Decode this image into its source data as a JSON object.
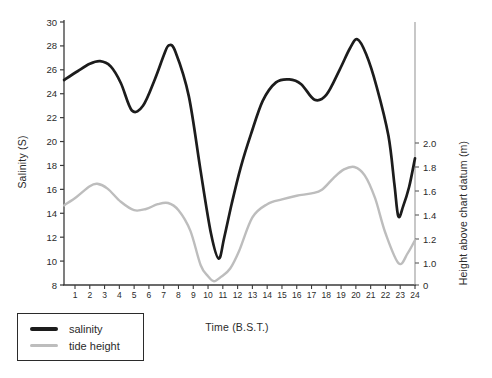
{
  "figure": {
    "background": "#ffffff"
  },
  "axes": {
    "left": {
      "label": "Salinity (S)",
      "ticks": [
        "30",
        "28",
        "26",
        "24",
        "22",
        "20",
        "18",
        "16",
        "14",
        "12",
        "10",
        "8"
      ]
    },
    "right": {
      "label": "Height above chart datum (m)",
      "ticks": [
        "2.0",
        "1.8",
        "1.6",
        "1.4",
        "1.2",
        "1.0",
        "0"
      ]
    },
    "x": {
      "label": "Time (B.S.T.)",
      "ticks": [
        "1",
        "2",
        "3",
        "4",
        "5",
        "6",
        "7",
        "8",
        "9",
        "10",
        "11",
        "12",
        "13",
        "14",
        "15",
        "16",
        "17",
        "18",
        "19",
        "20",
        "21",
        "22",
        "23",
        "24"
      ]
    }
  },
  "legend": {
    "items": [
      {
        "label": "salinity",
        "color": "#1c1c1c"
      },
      {
        "label": "tide height",
        "color": "#bdbdbd"
      }
    ]
  },
  "chart_data": {
    "type": "line",
    "title": "",
    "xlabel": "Time (B.S.T.)",
    "ylabel_left": "Salinity (S)",
    "ylabel_right": "Height above chart datum (m)",
    "grid": false,
    "legend_position": "bottom-left-outside",
    "x_hours": [
      1,
      2,
      3,
      4,
      5,
      6,
      7,
      8,
      9,
      10,
      11,
      12,
      13,
      14,
      15,
      16,
      17,
      18,
      19,
      20,
      21,
      22,
      23,
      24
    ],
    "ylim_left": [
      8,
      30
    ],
    "right_axis_tick_labels": [
      "2.0",
      "1.8",
      "1.6",
      "1.4",
      "1.2",
      "1.0",
      "0"
    ],
    "series": [
      {
        "name": "salinity",
        "axis": "left",
        "color": "#1c1c1c",
        "values": [
          25.7,
          26.5,
          26.6,
          25.2,
          22.7,
          24.1,
          27.5,
          27.2,
          21.0,
          13.2,
          11.5,
          16.5,
          20.5,
          24.3,
          25.1,
          25.2,
          23.7,
          23.9,
          26.3,
          28.5,
          25.8,
          21.0,
          14.0,
          18.6
        ]
      },
      {
        "name": "tide height",
        "axis": "right",
        "color": "#bdbdbd",
        "values": [
          1.54,
          1.64,
          1.63,
          1.52,
          1.44,
          1.46,
          1.5,
          1.44,
          1.15,
          0.35,
          0.45,
          1.08,
          1.38,
          1.49,
          1.53,
          1.56,
          1.58,
          1.66,
          1.77,
          1.8,
          1.62,
          1.25,
          0.98,
          1.19
        ]
      }
    ],
    "keypoints": {
      "salinity": [
        [
          0.26,
          25.15
        ],
        [
          1.2,
          25.9
        ],
        [
          2.0,
          26.5
        ],
        [
          2.7,
          26.72
        ],
        [
          3.4,
          26.3
        ],
        [
          4.1,
          24.9
        ],
        [
          4.85,
          22.6
        ],
        [
          5.6,
          23.0
        ],
        [
          6.4,
          25.2
        ],
        [
          7.0,
          27.2
        ],
        [
          7.35,
          28.05
        ],
        [
          7.8,
          27.5
        ],
        [
          8.7,
          23.8
        ],
        [
          9.5,
          17.5
        ],
        [
          10.2,
          12.3
        ],
        [
          10.72,
          10.2
        ],
        [
          11.1,
          12.0
        ],
        [
          11.6,
          14.8
        ],
        [
          12.2,
          17.8
        ],
        [
          12.9,
          20.6
        ],
        [
          13.7,
          23.4
        ],
        [
          14.6,
          24.95
        ],
        [
          15.5,
          25.2
        ],
        [
          16.3,
          24.8
        ],
        [
          17.2,
          23.5
        ],
        [
          18.0,
          23.9
        ],
        [
          18.9,
          26.0
        ],
        [
          19.6,
          27.8
        ],
        [
          20.1,
          28.55
        ],
        [
          20.7,
          27.3
        ],
        [
          21.4,
          24.6
        ],
        [
          22.2,
          20.5
        ],
        [
          22.6,
          16.5
        ],
        [
          22.87,
          13.75
        ],
        [
          23.2,
          14.6
        ],
        [
          23.6,
          16.2
        ],
        [
          24,
          18.6
        ]
      ],
      "tide_height": [
        [
          0.26,
          1.48
        ],
        [
          1.1,
          1.55
        ],
        [
          2.0,
          1.64
        ],
        [
          2.5,
          1.66
        ],
        [
          3.2,
          1.62
        ],
        [
          4.1,
          1.51
        ],
        [
          5.0,
          1.44
        ],
        [
          5.8,
          1.45
        ],
        [
          6.6,
          1.49
        ],
        [
          7.3,
          1.5
        ],
        [
          8.0,
          1.44
        ],
        [
          8.8,
          1.27
        ],
        [
          9.5,
          0.9
        ],
        [
          10.0,
          0.4
        ],
        [
          10.4,
          0.17
        ],
        [
          10.9,
          0.38
        ],
        [
          11.5,
          0.75
        ],
        [
          12.1,
          1.1
        ],
        [
          13.0,
          1.38
        ],
        [
          14.0,
          1.49
        ],
        [
          15.0,
          1.53
        ],
        [
          16.0,
          1.56
        ],
        [
          17.0,
          1.58
        ],
        [
          17.7,
          1.61
        ],
        [
          18.5,
          1.71
        ],
        [
          19.2,
          1.78
        ],
        [
          19.9,
          1.8
        ],
        [
          20.6,
          1.73
        ],
        [
          21.3,
          1.54
        ],
        [
          22.0,
          1.25
        ],
        [
          22.9,
          0.98
        ],
        [
          23.5,
          1.08
        ],
        [
          24,
          1.19
        ]
      ]
    }
  }
}
